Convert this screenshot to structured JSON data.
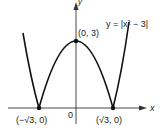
{
  "figure": {
    "equation": "y = |x² − 3|",
    "axis_x_label": "x",
    "axis_y_label": "y",
    "origin_label": "0",
    "points": [
      {
        "label": "(0, 3)",
        "x": 0,
        "y": 3
      },
      {
        "label": "(−√3, 0)",
        "x": -1.732,
        "y": 0
      },
      {
        "label": "(√3, 0)",
        "x": 1.732,
        "y": 0
      }
    ],
    "colors": {
      "curve": "#111111",
      "axes": "#333333",
      "text": "#222222"
    }
  }
}
